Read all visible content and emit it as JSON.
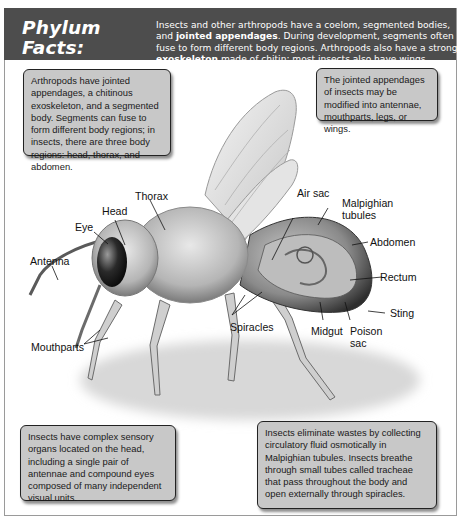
{
  "header": {
    "title_line1": "Phylum Facts:",
    "title_line2": "Arthropoda",
    "intro_parts": [
      "Insects and other arthropods have a coelom, segmented bodies, and ",
      "jointed appendages",
      ". During development, segments often fuse to form different body regions. Arthropods also have a strong ",
      "exoskeleton",
      " made of chitin; most insects also have wings."
    ]
  },
  "callouts": {
    "top_left": "Arthropods have jointed appendages, a chitinous exoskeleton, and a segmented body. Segments can fuse to form different body regions; in insects, there are three body regions: head, thorax, and abdomen.",
    "top_right": "The jointed appendages of insects may be modified into antennae, mouthparts, legs, or wings.",
    "bottom_left": "Insects have complex sensory organs located on the head, including a single pair of antennae and compound eyes composed of many independent visual units.",
    "bottom_right": "Insects eliminate wastes by collecting circulatory fluid osmotically in Malpighian tubules. Insects breathe through small tubes called tracheae that pass throughout the body and open externally through spiracles."
  },
  "labels": {
    "head": "Head",
    "thorax": "Thorax",
    "eye": "Eye",
    "antenna": "Antenna",
    "mouthparts": "Mouthparts",
    "air_sac": "Air sac",
    "malpighian_1": "Malpighian",
    "malpighian_2": "tubules",
    "abdomen": "Abdomen",
    "rectum": "Rectum",
    "sting": "Sting",
    "spiracles": "Spiracles",
    "midgut": "Midgut",
    "poison_1": "Poison",
    "poison_2": "sac"
  },
  "colors": {
    "header_bg": "#4d4d4d",
    "callout_bg": "#c8c8c8"
  }
}
